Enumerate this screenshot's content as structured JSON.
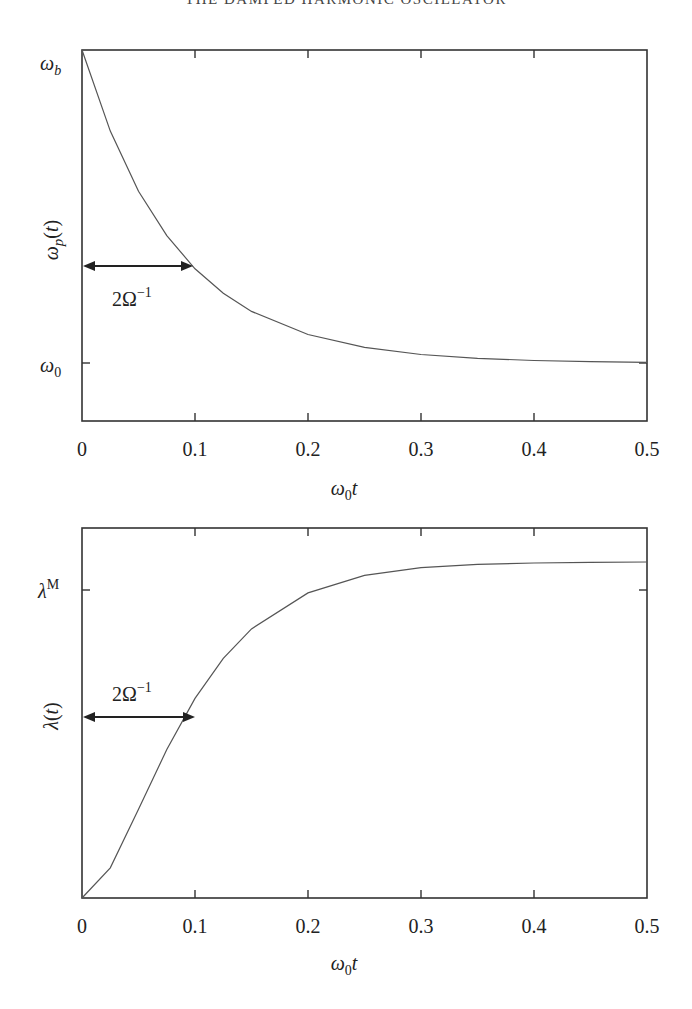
{
  "page": {
    "running_header": "THE DAMPED HARMONIC OSCILLATOR"
  },
  "chart_data": [
    {
      "type": "line",
      "title": "",
      "xlabel": "ω0 t",
      "ylabel": "ωp(t)",
      "xlim": [
        0,
        0.5
      ],
      "x_ticks": [
        "0",
        "0.1",
        "0.2",
        "0.3",
        "0.4",
        "0.5"
      ],
      "y_ticks": [
        {
          "label": "ωb",
          "position": "top",
          "normalized": 1.0
        },
        {
          "label": "ω0",
          "position": "lower",
          "normalized": 0.0
        }
      ],
      "grid": false,
      "annotation": {
        "text": "2Ω⁻¹",
        "type": "double-arrow",
        "x_from": 0,
        "x_to": 0.1,
        "label_below": true
      },
      "series": [
        {
          "name": "ωp(t)",
          "description": "exponential decay from ωb to ω0; normalized (ωp-ω0)/(ωb-ω0)",
          "x": [
            0,
            0.025,
            0.05,
            0.075,
            0.1,
            0.125,
            0.15,
            0.2,
            0.25,
            0.3,
            0.35,
            0.4,
            0.45,
            0.5
          ],
          "values": [
            1.0,
            0.741,
            0.549,
            0.407,
            0.301,
            0.223,
            0.165,
            0.091,
            0.05,
            0.027,
            0.015,
            0.008,
            0.004,
            0.002
          ]
        }
      ]
    },
    {
      "type": "line",
      "title": "",
      "xlabel": "ω0 t",
      "ylabel": "λ(t)",
      "xlim": [
        0,
        0.5
      ],
      "x_ticks": [
        "0",
        "0.1",
        "0.2",
        "0.3",
        "0.4",
        "0.5"
      ],
      "y_ticks": [
        {
          "label": "λM",
          "position": "upper",
          "normalized": 0.915
        }
      ],
      "grid": false,
      "annotation": {
        "text": "2Ω⁻¹",
        "type": "double-arrow",
        "x_from": 0,
        "x_to": 0.1,
        "label_above": true
      },
      "series": [
        {
          "name": "λ(t)",
          "description": "sigmoidal rise from 0 to plateau slightly above λM; normalized to plateau",
          "x": [
            0,
            0.025,
            0.05,
            0.075,
            0.1,
            0.125,
            0.15,
            0.2,
            0.25,
            0.3,
            0.35,
            0.4,
            0.45,
            0.5
          ],
          "values": [
            0.0,
            0.09,
            0.264,
            0.442,
            0.594,
            0.713,
            0.801,
            0.908,
            0.96,
            0.983,
            0.993,
            0.997,
            0.999,
            1.0
          ]
        }
      ]
    }
  ],
  "labels": {
    "top_ylabel_main": "ω",
    "top_ylabel_sub": "p",
    "top_ylabel_rest": "(t)",
    "top_ytick_top_main": "ω",
    "top_ytick_top_sub": "b",
    "top_ytick_low_main": "ω",
    "top_ytick_low_sub": "0",
    "xlabel_main": "ω",
    "xlabel_sub": "0",
    "xlabel_rest": "t",
    "bottom_ylabel": "λ(t)",
    "bottom_ytick_main": "λ",
    "bottom_ytick_sup": "M",
    "annotation_main": "2Ω",
    "annotation_sup": "−1"
  }
}
